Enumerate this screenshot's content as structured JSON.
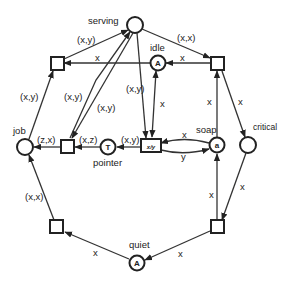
{
  "diagram": {
    "type": "petri-net",
    "places": [
      {
        "id": "serving",
        "label": "serving",
        "token": ""
      },
      {
        "id": "idle",
        "label": "idle",
        "token": "A"
      },
      {
        "id": "job",
        "label": "job",
        "token": ""
      },
      {
        "id": "pointer",
        "label": "pointer",
        "token": "T"
      },
      {
        "id": "soap",
        "label": "soap",
        "token": "a"
      },
      {
        "id": "critical",
        "label": "critical",
        "token": ""
      },
      {
        "id": "quiet",
        "label": "quiet",
        "token": "A"
      }
    ],
    "transitions": [
      {
        "id": "t-top-left",
        "label": ""
      },
      {
        "id": "t-top-right",
        "label": ""
      },
      {
        "id": "t-mid-left",
        "label": ""
      },
      {
        "id": "t-xy",
        "label": "x/y"
      },
      {
        "id": "t-bottom-left",
        "label": ""
      },
      {
        "id": "t-bottom-right",
        "label": ""
      }
    ],
    "arcs": [
      {
        "from": "t-top-left",
        "to": "serving",
        "label": "(x,y)"
      },
      {
        "from": "serving",
        "to": "t-top-right",
        "label": "(x,x)"
      },
      {
        "from": "t-top-right",
        "to": "idle",
        "label": "x"
      },
      {
        "from": "idle",
        "to": "t-top-left",
        "label": "x"
      },
      {
        "from": "job",
        "to": "t-top-left",
        "label": "(x,y)"
      },
      {
        "from": "t-mid-left",
        "to": "serving",
        "label": "(x,y)"
      },
      {
        "from": "serving",
        "to": "t-mid-left",
        "label": "(x,y)"
      },
      {
        "from": "serving",
        "to": "t-xy",
        "label": "(x,y)"
      },
      {
        "from": "idle",
        "to": "t-xy",
        "label": "x"
      },
      {
        "from": "t-mid-left",
        "to": "job",
        "label": "(z,x)"
      },
      {
        "from": "pointer",
        "to": "t-mid-left",
        "label": "(x,z)"
      },
      {
        "from": "t-xy",
        "to": "pointer",
        "label": "(x,y)"
      },
      {
        "from": "soap",
        "to": "t-xy",
        "label": "x"
      },
      {
        "from": "t-xy",
        "to": "soap",
        "label": "y"
      },
      {
        "from": "soap",
        "to": "t-top-right",
        "label": "x"
      },
      {
        "from": "t-top-right",
        "to": "critical",
        "label": "x"
      },
      {
        "from": "critical",
        "to": "t-bottom-right",
        "label": "x"
      },
      {
        "from": "t-bottom-right",
        "to": "soap",
        "label": "x"
      },
      {
        "from": "t-bottom-right",
        "to": "quiet",
        "label": "x"
      },
      {
        "from": "quiet",
        "to": "t-bottom-left",
        "label": "x"
      },
      {
        "from": "t-bottom-left",
        "to": "job",
        "label": "(x,x)"
      }
    ]
  }
}
